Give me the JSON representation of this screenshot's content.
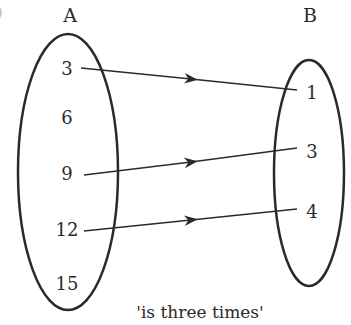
{
  "diagram": {
    "type": "arrow-mapping",
    "sets": {
      "A": {
        "label": "A",
        "elements": [
          "3",
          "6",
          "9",
          "12",
          "15"
        ]
      },
      "B": {
        "label": "B",
        "elements": [
          "1",
          "3",
          "4"
        ]
      }
    },
    "mappings": [
      {
        "from": "3",
        "to": "1"
      },
      {
        "from": "9",
        "to": "3"
      },
      {
        "from": "12",
        "to": "4"
      }
    ],
    "relation_label": "'is three times'",
    "colors": {
      "ink": "#2a2a2a",
      "background": "#ffffff"
    }
  }
}
